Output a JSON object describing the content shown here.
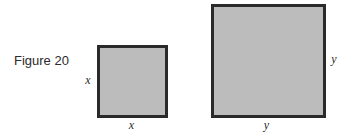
{
  "figure": {
    "caption": "Figure 20",
    "colors": {
      "fill": "#bcbcbc",
      "border": "#2a2a2a",
      "text": "#2b2b2b",
      "background": "#ffffff"
    },
    "shapes": [
      {
        "id": "small-square",
        "kind": "square",
        "side_label": "x",
        "labels": {
          "left": "x",
          "bottom": "x"
        },
        "box": {
          "left": 97,
          "top": 45,
          "width": 71,
          "height": 73
        }
      },
      {
        "id": "large-square",
        "kind": "square",
        "side_label": "y",
        "labels": {
          "right": "y",
          "bottom": "y"
        },
        "box": {
          "left": 211,
          "top": 4,
          "width": 115,
          "height": 114
        }
      }
    ]
  }
}
